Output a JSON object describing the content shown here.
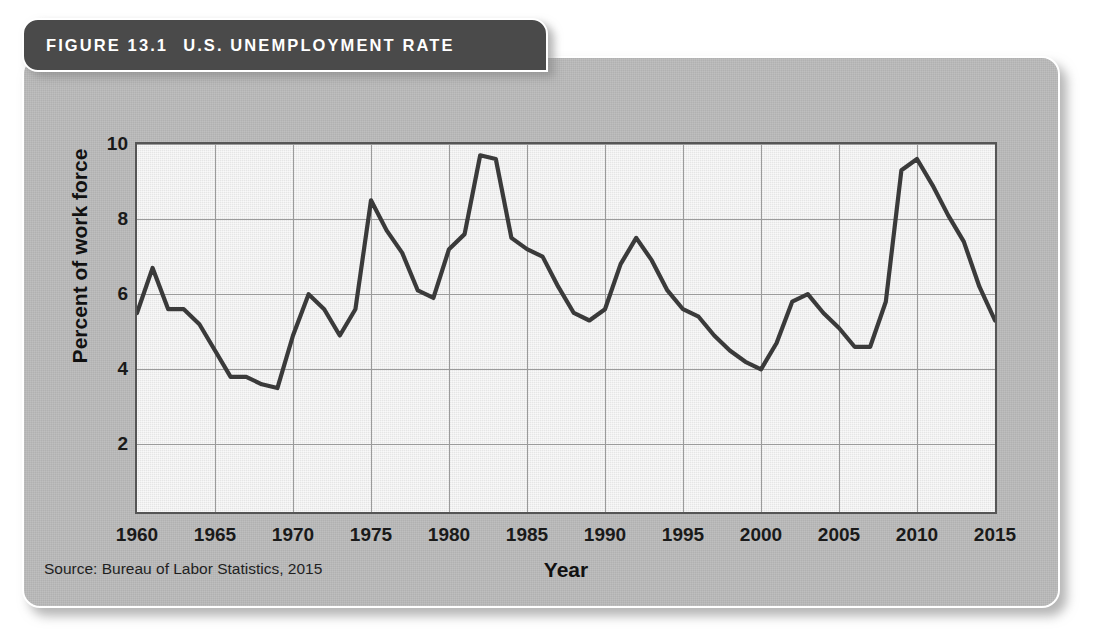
{
  "figure": {
    "number_label": "FIGURE 13.1",
    "title": "U.S. UNEMPLOYMENT RATE",
    "source": "Source: Bureau of Labor Statistics, 2015",
    "header_bg": "#4a4a4a",
    "panel_bg": "#b9b9b9",
    "plot_bg": "#ebebeb",
    "line_color": "#3a3a3a",
    "grid_color": "#9a9a9a"
  },
  "chart_data": {
    "type": "line",
    "title": "U.S. Unemployment Rate",
    "xlabel": "Year",
    "ylabel": "Percent of work force",
    "xlim": [
      1960,
      2015
    ],
    "ylim": [
      0.2,
      10
    ],
    "grid": true,
    "legend": "none",
    "xticks": [
      1960,
      1965,
      1970,
      1975,
      1980,
      1985,
      1990,
      1995,
      2000,
      2005,
      2010,
      2015
    ],
    "yticks": [
      2,
      4,
      6,
      8,
      10
    ],
    "series": [
      {
        "name": "Unemployment rate",
        "x": [
          1960,
          1961,
          1962,
          1963,
          1964,
          1965,
          1966,
          1967,
          1968,
          1969,
          1970,
          1971,
          1972,
          1973,
          1974,
          1975,
          1976,
          1977,
          1978,
          1979,
          1980,
          1981,
          1982,
          1983,
          1984,
          1985,
          1986,
          1987,
          1988,
          1989,
          1990,
          1991,
          1992,
          1993,
          1994,
          1995,
          1996,
          1997,
          1998,
          1999,
          2000,
          2001,
          2002,
          2003,
          2004,
          2005,
          2006,
          2007,
          2008,
          2009,
          2010,
          2011,
          2012,
          2013,
          2014,
          2015
        ],
        "values": [
          5.5,
          6.7,
          5.6,
          5.6,
          5.2,
          4.5,
          3.8,
          3.8,
          3.6,
          3.5,
          4.9,
          6.0,
          5.6,
          4.9,
          5.6,
          8.5,
          7.7,
          7.1,
          6.1,
          5.9,
          7.2,
          7.6,
          9.7,
          9.6,
          7.5,
          7.2,
          7.0,
          6.2,
          5.5,
          5.3,
          5.6,
          6.8,
          7.5,
          6.9,
          6.1,
          5.6,
          5.4,
          4.9,
          4.5,
          4.2,
          4.0,
          4.7,
          5.8,
          6.0,
          5.5,
          5.1,
          4.6,
          4.6,
          5.8,
          9.3,
          9.6,
          8.9,
          8.1,
          7.4,
          6.2,
          5.3
        ]
      }
    ]
  }
}
